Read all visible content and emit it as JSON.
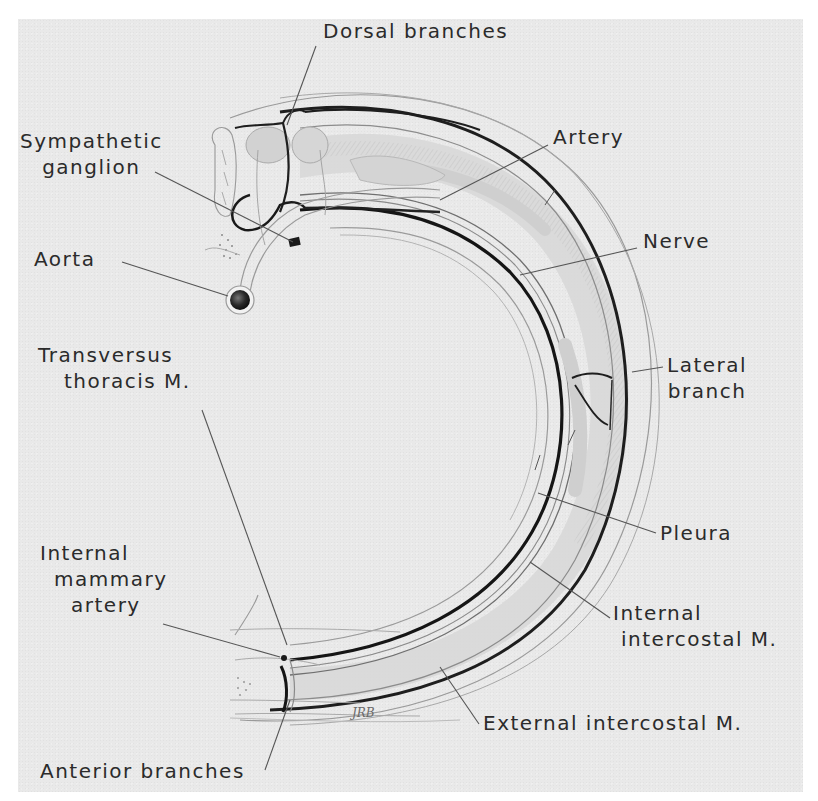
{
  "figure": {
    "background_color": "#e9e9e9",
    "ink_color": "#2b2b2b",
    "signature": "JRB"
  },
  "labels": {
    "dorsal_branches": "Dorsal branches",
    "sympathetic_ganglion_line1": "Sympathetic",
    "sympathetic_ganglion_line2": "ganglion",
    "aorta": "Aorta",
    "artery": "Artery",
    "nerve": "Nerve",
    "lateral_branch_line1": "Lateral",
    "lateral_branch_line2": "branch",
    "transversus_thoracis_line1": "Transversus",
    "transversus_thoracis_line2": "thoracis M.",
    "pleura": "Pleura",
    "internal_mammary_line1": "Internal",
    "internal_mammary_line2": "mammary",
    "internal_mammary_line3": "artery",
    "internal_intercostal_line1": "Internal",
    "internal_intercostal_line2": "intercostal M.",
    "external_intercostal": "External intercostal M.",
    "anterior_branches": "Anterior branches"
  }
}
